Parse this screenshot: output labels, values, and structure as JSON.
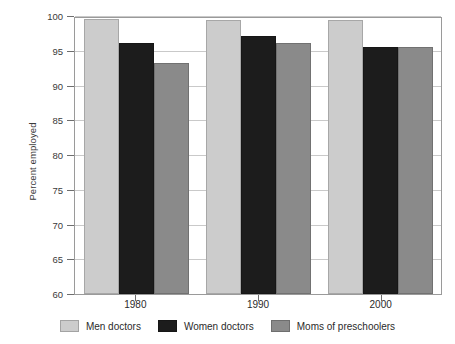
{
  "chart_data": {
    "type": "bar",
    "title": "",
    "xlabel": "",
    "ylabel": "Percent employed",
    "ylim": [
      60,
      100
    ],
    "yticks": [
      60,
      65,
      70,
      75,
      80,
      85,
      90,
      95,
      100
    ],
    "grid": true,
    "legend_position": "bottom",
    "categories": [
      "1980",
      "1990",
      "2000"
    ],
    "series": [
      {
        "name": "Men doctors",
        "color": "#cccccc",
        "values": [
          99.5,
          99.4,
          99.4
        ]
      },
      {
        "name": "Women doctors",
        "color": "#1c1c1c",
        "values": [
          96.1,
          97.1,
          95.5
        ]
      },
      {
        "name": "Moms of preschoolers",
        "color": "#8a8a8a",
        "values": [
          93.2,
          96.1,
          95.5
        ]
      }
    ]
  }
}
